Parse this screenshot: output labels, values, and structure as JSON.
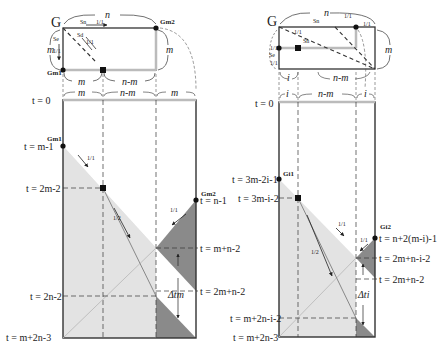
{
  "left": {
    "top": {
      "corner_label": "G",
      "top_dim": "n",
      "left_dim": "m",
      "right_dim": "m",
      "bottom_dims": [
        "m",
        "n-m"
      ],
      "sweep_top_label": "Sn",
      "sweep_left_label": "Se",
      "sweep_diag_label": "Sd",
      "rate_top": "1/1",
      "rate_left": "1/1",
      "rate_diag": "1/1",
      "node_bl": "Gm1",
      "node_tr": "Gm2"
    },
    "timeline": {
      "column_dims": [
        "m",
        "n-m",
        "m"
      ],
      "t0": "t = 0",
      "node_a": "Gm1",
      "node_b": "Gm2",
      "t_a": "t = m-1",
      "t_sq": "t = 2m-2",
      "t_b": "t = n-1",
      "t_mn2": "t = m+n-2",
      "t_2mn2": "t = 2m+n-2",
      "t_2n2": "t = 2n-2",
      "t_end": "t = m+2n-3",
      "rate_a": "1/1",
      "rate_b": "1/1",
      "rate_c": "1/2",
      "delta": "Δtm"
    }
  },
  "right": {
    "top": {
      "corner_label": "G",
      "top_dim": "n",
      "right_dim": "m",
      "bottom_dims": [
        "i",
        "n-m"
      ],
      "sweep_top_label": "Sn",
      "sweep_left_label": "Se",
      "sweep_diag_label": "Sn",
      "rate_top_a": "1/1",
      "rate_top_b": "1/1",
      "rate_left_a": "1/1",
      "rate_left_b": "1/1",
      "rate_diag": "1/1"
    },
    "timeline": {
      "column_dims": [
        "i",
        "n-m",
        "i"
      ],
      "t0": "t = 0",
      "node_a": "Gi1",
      "node_b": "Gi2",
      "t_a": "t = 3m-2i-1",
      "t_sq": "t = 3m-i-2",
      "t_b": "t = n+2(m-i)-1",
      "t_mid": "t = 2m+n-i-2",
      "t_2mn2": "t = 2m+n-2",
      "t_low": "t = m+2n-i-2",
      "t_end": "t = m+2n-3",
      "rate_a": "1/1",
      "rate_b": "1/1",
      "rate_c": "1/2",
      "delta": "Δti"
    }
  },
  "colors": {
    "light_fill": "#e3e3e3",
    "dark_fill": "#8a8a8a",
    "outline": "#333333",
    "gray_edge": "#b8b8b8"
  }
}
